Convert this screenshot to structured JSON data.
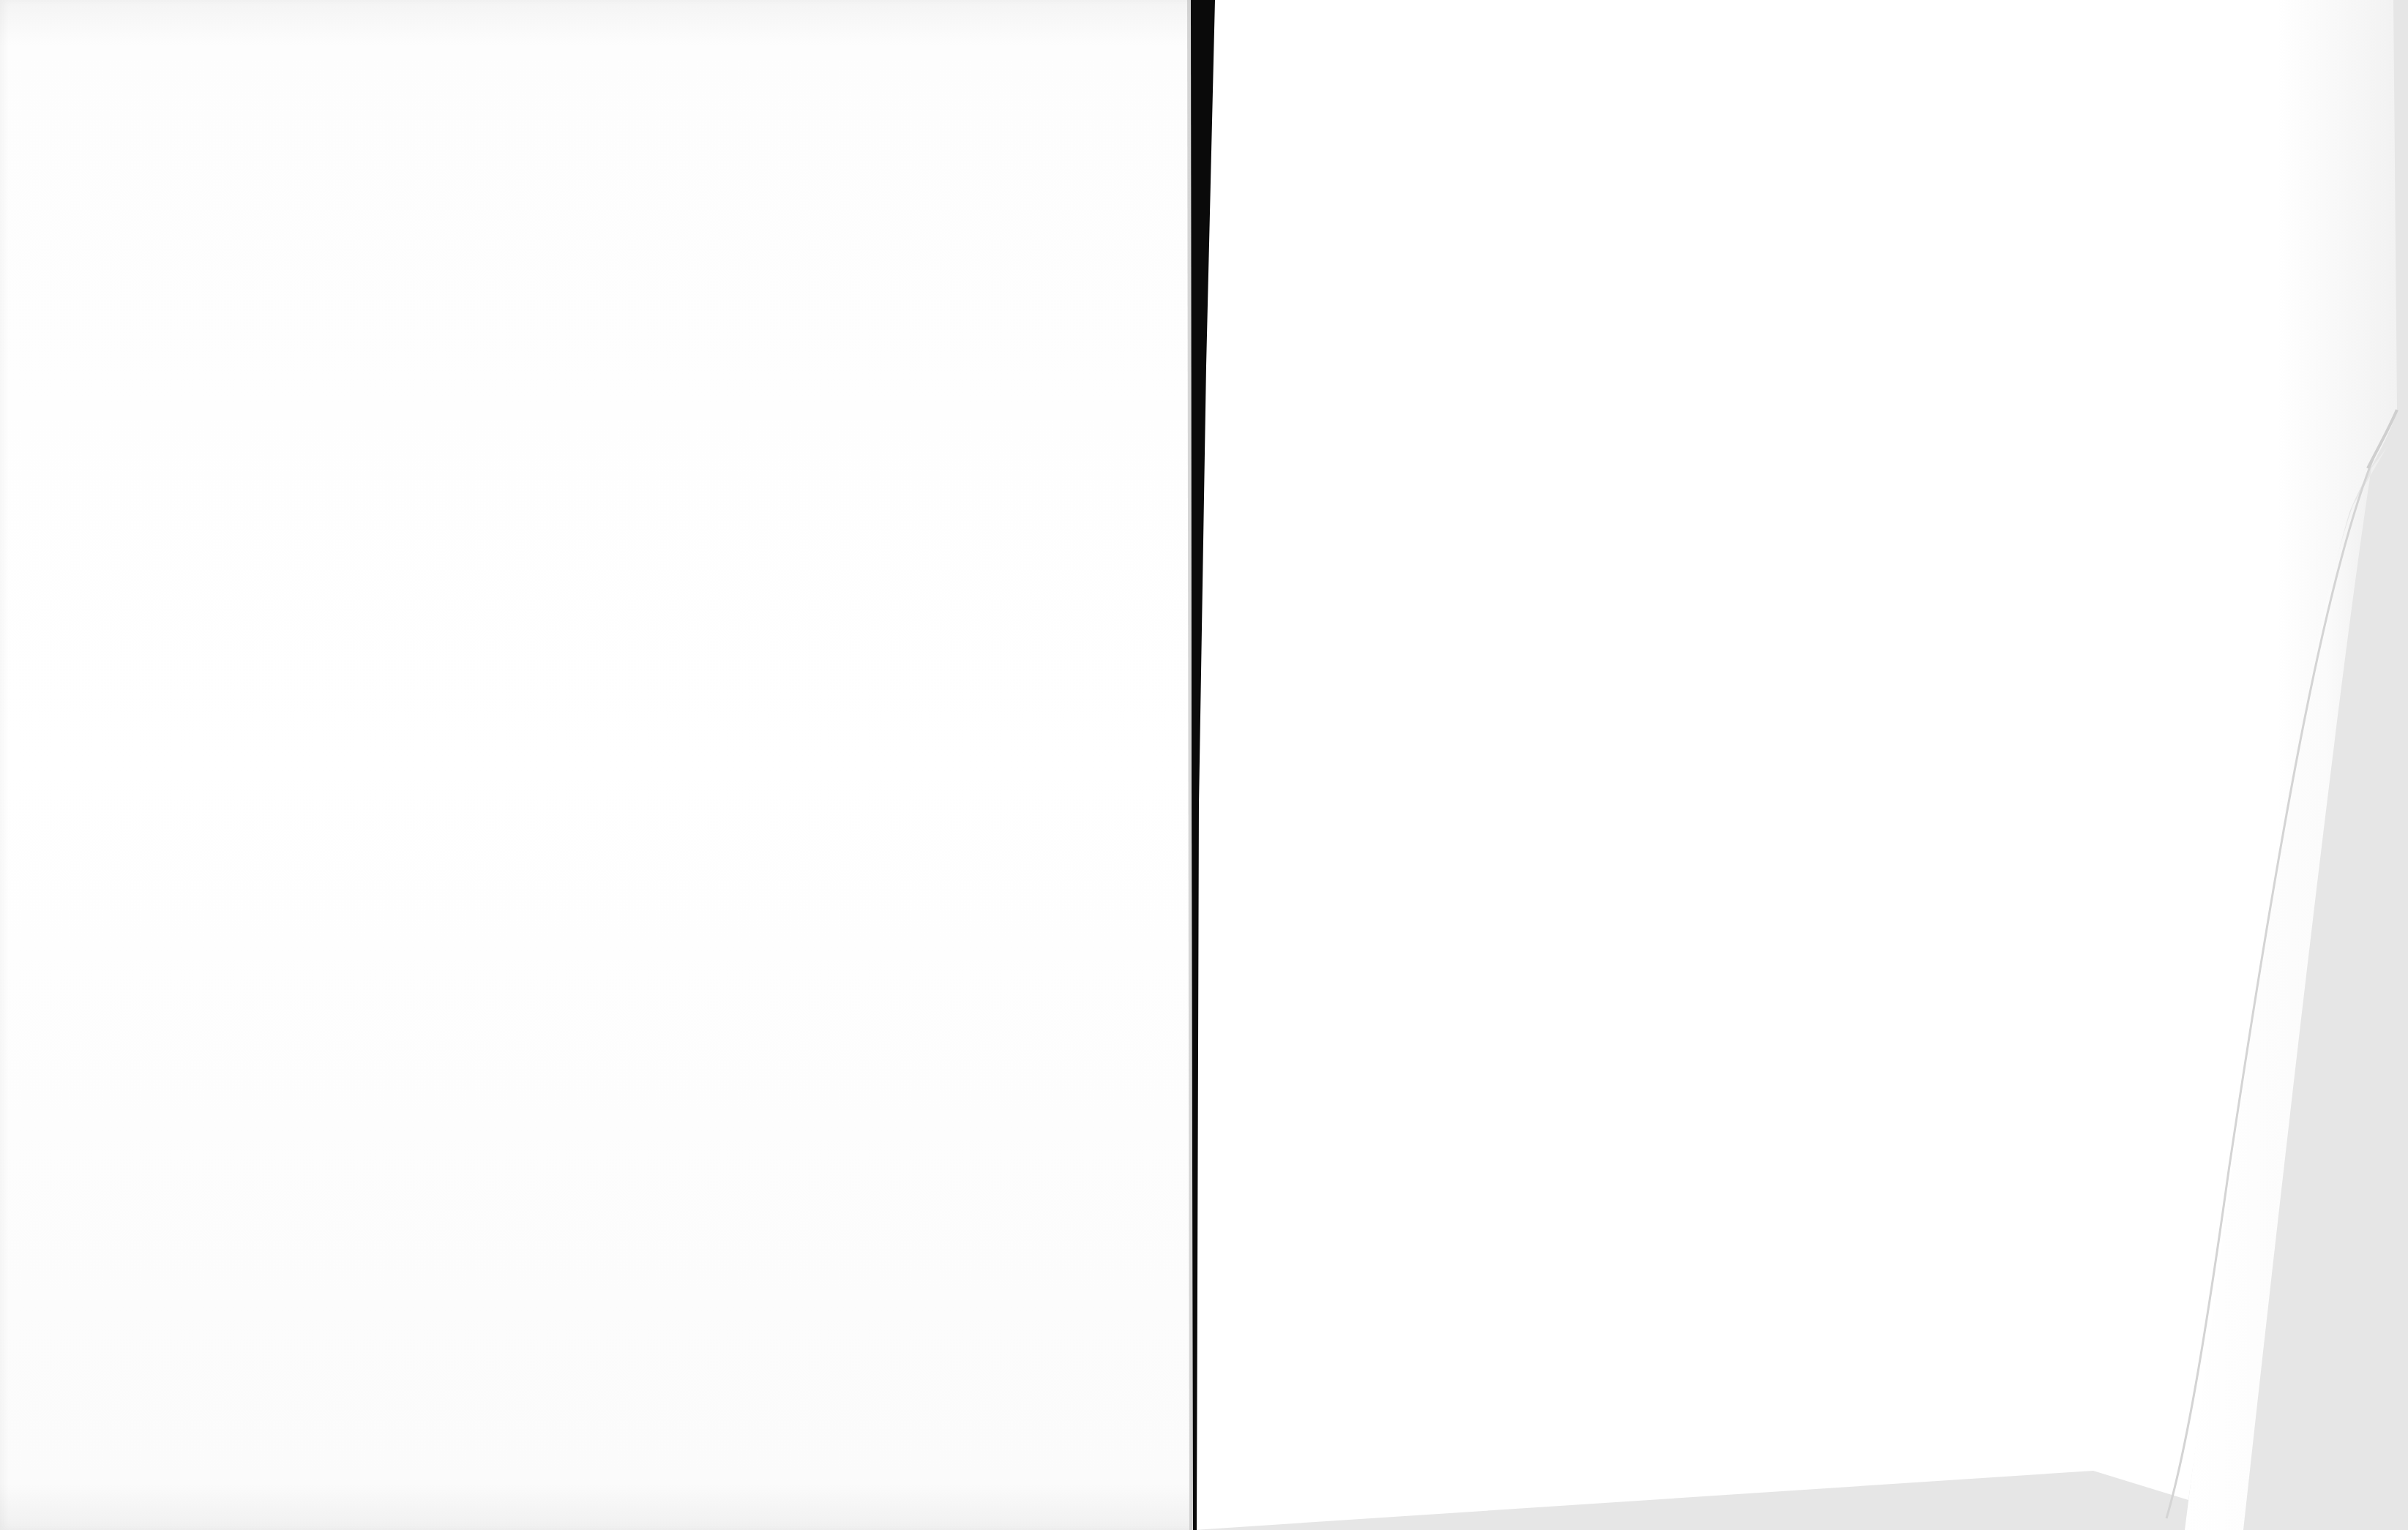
{
  "document": {
    "type": "book-spread-scan",
    "pages": [
      {
        "side": "left",
        "content": ""
      },
      {
        "side": "right",
        "content": ""
      }
    ]
  },
  "colors": {
    "page": "#ffffff",
    "background": "#e6e6e6",
    "gutter": "#0a0a0a"
  }
}
